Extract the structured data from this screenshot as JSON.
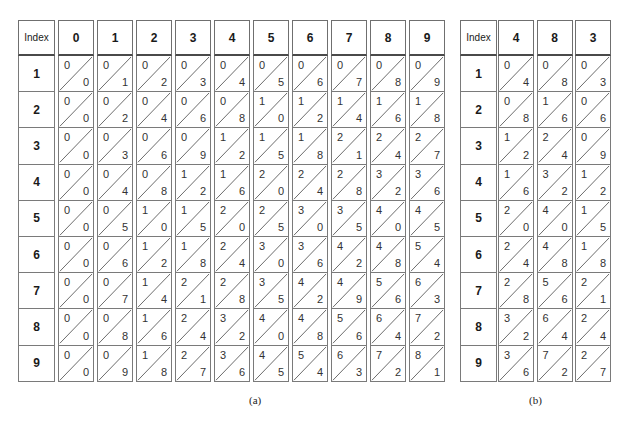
{
  "figure": {
    "table_a": {
      "caption": "(a)",
      "index_label": "Index",
      "index_values": [
        "1",
        "2",
        "3",
        "4",
        "5",
        "6",
        "7",
        "8",
        "9"
      ],
      "columns": [
        {
          "header": "0",
          "cells": [
            [
              "0",
              "0"
            ],
            [
              "0",
              "0"
            ],
            [
              "0",
              "0"
            ],
            [
              "0",
              "0"
            ],
            [
              "0",
              "0"
            ],
            [
              "0",
              "0"
            ],
            [
              "0",
              "0"
            ],
            [
              "0",
              "0"
            ],
            [
              "0",
              "0"
            ]
          ]
        },
        {
          "header": "1",
          "cells": [
            [
              "0",
              "1"
            ],
            [
              "0",
              "2"
            ],
            [
              "0",
              "3"
            ],
            [
              "0",
              "4"
            ],
            [
              "0",
              "5"
            ],
            [
              "0",
              "6"
            ],
            [
              "0",
              "7"
            ],
            [
              "0",
              "8"
            ],
            [
              "0",
              "9"
            ]
          ]
        },
        {
          "header": "2",
          "cells": [
            [
              "0",
              "2"
            ],
            [
              "0",
              "4"
            ],
            [
              "0",
              "6"
            ],
            [
              "0",
              "8"
            ],
            [
              "1",
              "0"
            ],
            [
              "1",
              "2"
            ],
            [
              "1",
              "4"
            ],
            [
              "1",
              "6"
            ],
            [
              "1",
              "8"
            ]
          ]
        },
        {
          "header": "3",
          "cells": [
            [
              "0",
              "3"
            ],
            [
              "0",
              "6"
            ],
            [
              "0",
              "9"
            ],
            [
              "1",
              "2"
            ],
            [
              "1",
              "5"
            ],
            [
              "1",
              "8"
            ],
            [
              "2",
              "1"
            ],
            [
              "2",
              "4"
            ],
            [
              "2",
              "7"
            ]
          ]
        },
        {
          "header": "4",
          "cells": [
            [
              "0",
              "4"
            ],
            [
              "0",
              "8"
            ],
            [
              "1",
              "2"
            ],
            [
              "1",
              "6"
            ],
            [
              "2",
              "0"
            ],
            [
              "2",
              "4"
            ],
            [
              "2",
              "8"
            ],
            [
              "3",
              "2"
            ],
            [
              "3",
              "6"
            ]
          ]
        },
        {
          "header": "5",
          "cells": [
            [
              "0",
              "5"
            ],
            [
              "1",
              "0"
            ],
            [
              "1",
              "5"
            ],
            [
              "2",
              "0"
            ],
            [
              "2",
              "5"
            ],
            [
              "3",
              "0"
            ],
            [
              "3",
              "5"
            ],
            [
              "4",
              "0"
            ],
            [
              "4",
              "5"
            ]
          ]
        },
        {
          "header": "6",
          "cells": [
            [
              "0",
              "6"
            ],
            [
              "1",
              "2"
            ],
            [
              "1",
              "8"
            ],
            [
              "2",
              "4"
            ],
            [
              "3",
              "0"
            ],
            [
              "3",
              "6"
            ],
            [
              "4",
              "2"
            ],
            [
              "4",
              "8"
            ],
            [
              "5",
              "4"
            ]
          ]
        },
        {
          "header": "7",
          "cells": [
            [
              "0",
              "7"
            ],
            [
              "1",
              "4"
            ],
            [
              "2",
              "1"
            ],
            [
              "2",
              "8"
            ],
            [
              "3",
              "5"
            ],
            [
              "4",
              "2"
            ],
            [
              "4",
              "9"
            ],
            [
              "5",
              "6"
            ],
            [
              "6",
              "3"
            ]
          ]
        },
        {
          "header": "8",
          "cells": [
            [
              "0",
              "8"
            ],
            [
              "1",
              "6"
            ],
            [
              "2",
              "4"
            ],
            [
              "3",
              "2"
            ],
            [
              "4",
              "0"
            ],
            [
              "4",
              "8"
            ],
            [
              "5",
              "6"
            ],
            [
              "6",
              "4"
            ],
            [
              "7",
              "2"
            ]
          ]
        },
        {
          "header": "9",
          "cells": [
            [
              "0",
              "9"
            ],
            [
              "1",
              "8"
            ],
            [
              "2",
              "7"
            ],
            [
              "3",
              "6"
            ],
            [
              "4",
              "5"
            ],
            [
              "5",
              "4"
            ],
            [
              "6",
              "3"
            ],
            [
              "7",
              "2"
            ],
            [
              "8",
              "1"
            ]
          ]
        }
      ]
    },
    "table_b": {
      "caption": "(b)",
      "index_label": "Index",
      "index_values": [
        "1",
        "2",
        "3",
        "4",
        "5",
        "6",
        "7",
        "8",
        "9"
      ],
      "columns": [
        {
          "header": "4",
          "cells": [
            [
              "0",
              "4"
            ],
            [
              "0",
              "8"
            ],
            [
              "1",
              "2"
            ],
            [
              "1",
              "6"
            ],
            [
              "2",
              "0"
            ],
            [
              "2",
              "4"
            ],
            [
              "2",
              "8"
            ],
            [
              "3",
              "2"
            ],
            [
              "3",
              "6"
            ]
          ]
        },
        {
          "header": "8",
          "cells": [
            [
              "0",
              "8"
            ],
            [
              "1",
              "6"
            ],
            [
              "2",
              "4"
            ],
            [
              "3",
              "2"
            ],
            [
              "4",
              "0"
            ],
            [
              "4",
              "8"
            ],
            [
              "5",
              "6"
            ],
            [
              "6",
              "4"
            ],
            [
              "7",
              "2"
            ]
          ]
        },
        {
          "header": "3",
          "cells": [
            [
              "0",
              "3"
            ],
            [
              "0",
              "6"
            ],
            [
              "0",
              "9"
            ],
            [
              "1",
              "2"
            ],
            [
              "1",
              "5"
            ],
            [
              "1",
              "8"
            ],
            [
              "2",
              "1"
            ],
            [
              "2",
              "4"
            ],
            [
              "2",
              "7"
            ]
          ]
        }
      ]
    }
  }
}
